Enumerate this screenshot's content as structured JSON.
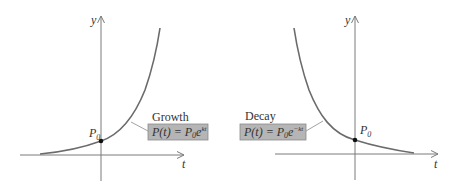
{
  "colors": {
    "background": "#ffffff",
    "axis": "#7a7a7a",
    "curve": "#6b6b6b",
    "point": "#111111",
    "text": "#333333",
    "box_fill": "#b5b5b5",
    "box_stroke": "#8a8a8a"
  },
  "growth": {
    "title": "Growth",
    "formula_lhs": "P(t) = P",
    "formula_sub": "0",
    "formula_base": "e",
    "formula_exp": "kt",
    "point_label": "P",
    "point_sub": "0",
    "x_axis_label": "t",
    "y_axis_label": "y"
  },
  "decay": {
    "title": "Decay",
    "formula_lhs": "P(t) = P",
    "formula_sub": "0",
    "formula_base": "e",
    "formula_exp": "−kt",
    "point_label": "P",
    "point_sub": "0",
    "x_axis_label": "t",
    "y_axis_label": "y"
  }
}
